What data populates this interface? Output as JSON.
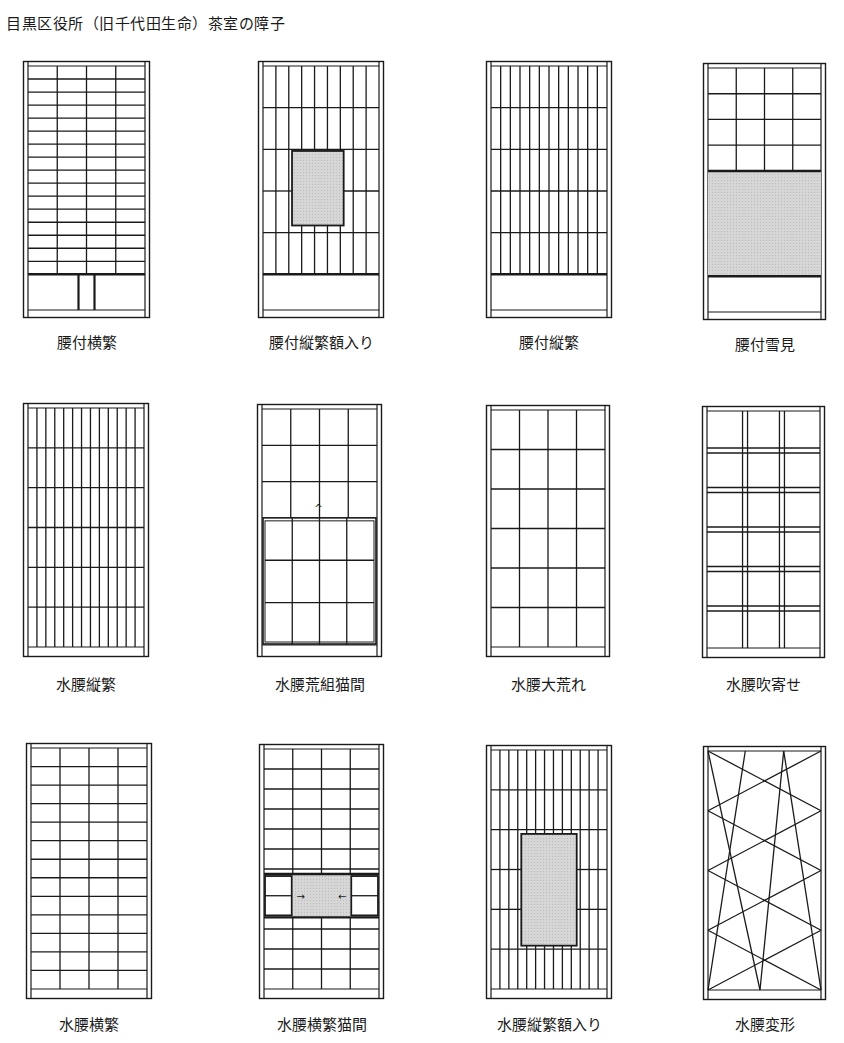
{
  "title": "目黒区役所（旧千代田生命）茶室の障子",
  "colors": {
    "line": "#1a1a1a",
    "shade": "#d6d6d6",
    "background": "#ffffff"
  },
  "panels": [
    {
      "id": "p1",
      "label": "腰付横繁",
      "x": 23,
      "y": 61,
      "w": 127,
      "h": 257,
      "label_y": 331,
      "type": "koshi_yoko"
    },
    {
      "id": "p2",
      "label": "腰付縦繁額入り",
      "x": 258,
      "y": 61,
      "w": 126,
      "h": 257,
      "label_y": 331,
      "type": "koshi_tate_gaku"
    },
    {
      "id": "p3",
      "label": "腰付縦繁",
      "x": 486,
      "y": 61,
      "w": 126,
      "h": 257,
      "label_y": 331,
      "type": "koshi_tate"
    },
    {
      "id": "p4",
      "label": "腰付雪見",
      "x": 703,
      "y": 63,
      "w": 123,
      "h": 257,
      "label_y": 333,
      "type": "koshi_yukimi"
    },
    {
      "id": "p5",
      "label": "水腰縦繁",
      "x": 23,
      "y": 403,
      "w": 126,
      "h": 254,
      "label_y": 673,
      "type": "mizu_tate"
    },
    {
      "id": "p6",
      "label": "水腰荒組猫間",
      "x": 257,
      "y": 404,
      "w": 125,
      "h": 253,
      "label_y": 673,
      "type": "mizu_aragumi_nekoma"
    },
    {
      "id": "p7",
      "label": "水腰大荒れ",
      "x": 486,
      "y": 405,
      "w": 124,
      "h": 252,
      "label_y": 673,
      "type": "mizu_oare"
    },
    {
      "id": "p8",
      "label": "水腰吹寄せ",
      "x": 702,
      "y": 406,
      "w": 123,
      "h": 252,
      "label_y": 673,
      "type": "mizu_fukiyose"
    },
    {
      "id": "p9",
      "label": "水腰横繁",
      "x": 26,
      "y": 743,
      "w": 126,
      "h": 256,
      "label_y": 1013,
      "type": "mizu_yoko"
    },
    {
      "id": "p10",
      "label": "水腰横繁猫間",
      "x": 259,
      "y": 744,
      "w": 125,
      "h": 255,
      "label_y": 1013,
      "type": "mizu_yoko_nekoma"
    },
    {
      "id": "p11",
      "label": "水腰縦繁額入り",
      "x": 486,
      "y": 745,
      "w": 126,
      "h": 254,
      "label_y": 1013,
      "type": "mizu_tate_gaku"
    },
    {
      "id": "p12",
      "label": "水腰変形",
      "x": 703,
      "y": 746,
      "w": 123,
      "h": 254,
      "label_y": 1013,
      "type": "mizu_henkei"
    }
  ]
}
